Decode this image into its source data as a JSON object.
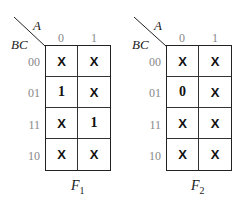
{
  "maps": [
    {
      "name": "F",
      "subscript": "1",
      "col_var": "A",
      "row_var": "BC",
      "col_labels": [
        "0",
        "1"
      ],
      "row_labels": [
        "00",
        "01",
        "11",
        "10"
      ],
      "cells": [
        [
          "X",
          "X"
        ],
        [
          "1",
          "X"
        ],
        [
          "X",
          "1"
        ],
        [
          "X",
          "X"
        ]
      ]
    },
    {
      "name": "F",
      "subscript": "2",
      "col_var": "A",
      "row_var": "BC",
      "col_labels": [
        "0",
        "1"
      ],
      "row_labels": [
        "00",
        "01",
        "11",
        "10"
      ],
      "cells": [
        [
          "X",
          "X"
        ],
        [
          "0",
          "X"
        ],
        [
          "X",
          "X"
        ],
        [
          "X",
          "X"
        ]
      ]
    }
  ]
}
